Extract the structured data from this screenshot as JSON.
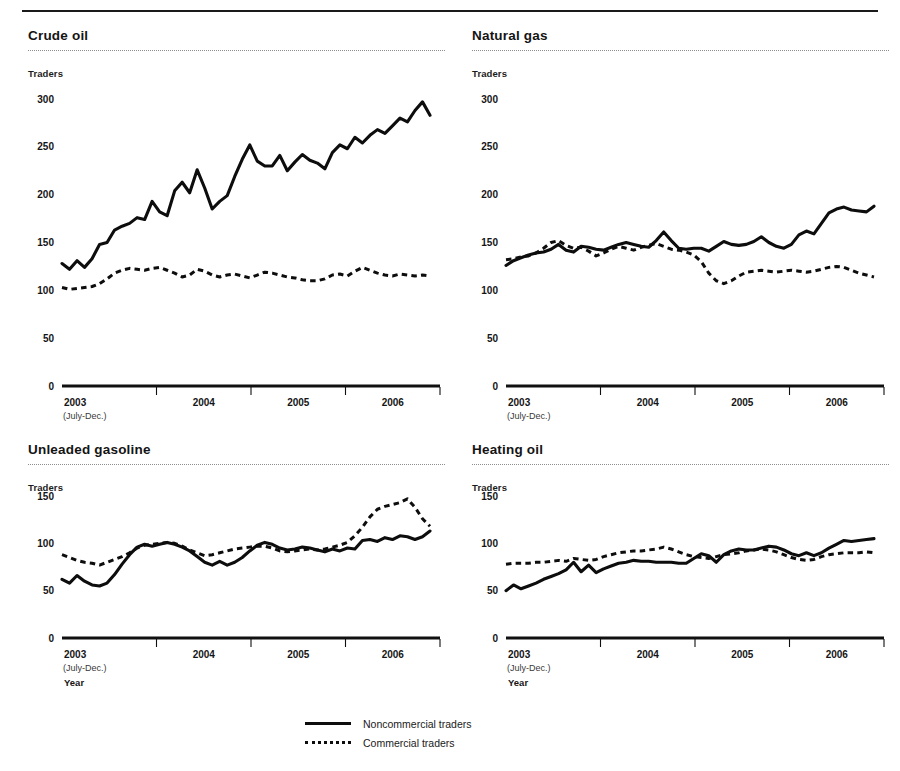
{
  "page": {
    "top_rule": true
  },
  "legend": {
    "items": [
      {
        "label": "Noncommercial traders",
        "style": "solid"
      },
      {
        "label": "Commercial traders",
        "style": "dotted"
      }
    ]
  },
  "chart_data": [
    {
      "type": "line",
      "title": "Crude oil",
      "ylabel": "Traders",
      "xlabel": "Year",
      "ylim": [
        0,
        300
      ],
      "yticks": [
        0,
        50,
        100,
        150,
        200,
        250,
        300
      ],
      "ytick_labels": [
        "0",
        "50",
        "100",
        "150",
        "200",
        "250",
        "300"
      ],
      "xtick_labels": [
        "2003",
        "2004",
        "2005",
        "2006"
      ],
      "x_sublabel": "(July-Dec.)",
      "grid": false,
      "legend_position": "bottom-center-shared",
      "series": [
        {
          "name": "Noncommercial traders",
          "style": "solid",
          "values": [
            128,
            122,
            131,
            124,
            133,
            148,
            150,
            163,
            167,
            170,
            176,
            174,
            193,
            182,
            178,
            204,
            213,
            202,
            226,
            207,
            185,
            193,
            199,
            219,
            237,
            252,
            235,
            230,
            230,
            241,
            225,
            234,
            242,
            236,
            233,
            227,
            244,
            252,
            248,
            260,
            254,
            262,
            268,
            264,
            272,
            280,
            276,
            288,
            297,
            283
          ]
        },
        {
          "name": "Commercial traders",
          "style": "dotted",
          "values": [
            103,
            101,
            102,
            103,
            104,
            107,
            112,
            118,
            121,
            123,
            122,
            121,
            123,
            124,
            121,
            118,
            114,
            116,
            122,
            120,
            116,
            114,
            116,
            117,
            115,
            113,
            116,
            119,
            118,
            116,
            114,
            113,
            111,
            110,
            110,
            112,
            116,
            117,
            115,
            120,
            124,
            121,
            118,
            116,
            115,
            117,
            116,
            115,
            116,
            115
          ]
        }
      ]
    },
    {
      "type": "line",
      "title": "Natural gas",
      "ylabel": "Traders",
      "xlabel": "Year",
      "ylim": [
        0,
        300
      ],
      "yticks": [
        0,
        50,
        100,
        150,
        200,
        250,
        300
      ],
      "ytick_labels": [
        "0",
        "50",
        "100",
        "150",
        "200",
        "250",
        "300"
      ],
      "xtick_labels": [
        "2003",
        "2004",
        "2005",
        "2006"
      ],
      "x_sublabel": "(July-Dec.)",
      "grid": false,
      "legend_position": "bottom-center-shared",
      "series": [
        {
          "name": "Noncommercial traders",
          "style": "solid",
          "values": [
            126,
            131,
            134,
            137,
            139,
            140,
            143,
            148,
            142,
            140,
            146,
            145,
            143,
            142,
            145,
            148,
            150,
            148,
            146,
            145,
            152,
            161,
            152,
            144,
            143,
            144,
            144,
            141,
            146,
            151,
            148,
            147,
            148,
            151,
            156,
            150,
            146,
            144,
            148,
            158,
            162,
            159,
            170,
            181,
            185,
            187,
            184,
            183,
            182,
            188
          ]
        },
        {
          "name": "Commercial traders",
          "style": "dotted",
          "values": [
            132,
            133,
            135,
            136,
            139,
            144,
            150,
            152,
            147,
            144,
            145,
            141,
            136,
            139,
            143,
            146,
            144,
            142,
            145,
            147,
            149,
            146,
            143,
            142,
            140,
            137,
            130,
            118,
            110,
            107,
            110,
            115,
            119,
            120,
            121,
            120,
            119,
            120,
            121,
            120,
            119,
            120,
            122,
            124,
            125,
            124,
            121,
            118,
            116,
            114
          ]
        }
      ]
    },
    {
      "type": "line",
      "title": "Unleaded gasoline",
      "ylabel": "Traders",
      "xlabel": "Year",
      "ylim": [
        0,
        150
      ],
      "yticks": [
        0,
        50,
        100,
        150
      ],
      "ytick_labels": [
        "0",
        "50",
        "100",
        "150"
      ],
      "xtick_labels": [
        "2003",
        "2004",
        "2005",
        "2006"
      ],
      "x_sublabel": "(July-Dec.)",
      "grid": false,
      "legend_position": "bottom-center-shared",
      "series": [
        {
          "name": "Noncommercial traders",
          "style": "solid",
          "values": [
            62,
            58,
            66,
            60,
            56,
            55,
            58,
            67,
            78,
            88,
            96,
            99,
            97,
            99,
            101,
            99,
            96,
            92,
            86,
            80,
            77,
            81,
            77,
            80,
            85,
            92,
            98,
            101,
            99,
            95,
            93,
            94,
            96,
            95,
            93,
            91,
            94,
            92,
            95,
            94,
            103,
            104,
            102,
            106,
            104,
            108,
            107,
            104,
            107,
            113
          ]
        },
        {
          "name": "Commercial traders",
          "style": "dotted",
          "values": [
            88,
            85,
            82,
            80,
            79,
            77,
            80,
            83,
            86,
            90,
            95,
            98,
            99,
            100,
            101,
            100,
            97,
            93,
            90,
            87,
            88,
            90,
            92,
            94,
            95,
            96,
            97,
            97,
            95,
            92,
            91,
            92,
            93,
            94,
            93,
            94,
            96,
            98,
            101,
            108,
            117,
            128,
            136,
            139,
            141,
            143,
            147,
            138,
            126,
            118
          ]
        }
      ]
    },
    {
      "type": "line",
      "title": "Heating oil",
      "ylabel": "Traders",
      "xlabel": "Year",
      "ylim": [
        0,
        150
      ],
      "yticks": [
        0,
        50,
        100,
        150
      ],
      "ytick_labels": [
        "0",
        "50",
        "100",
        "150"
      ],
      "xtick_labels": [
        "2003",
        "2004",
        "2005",
        "2006"
      ],
      "x_sublabel": "(July-Dec.)",
      "grid": false,
      "legend_position": "bottom-center-shared",
      "series": [
        {
          "name": "Noncommercial traders",
          "style": "solid",
          "values": [
            50,
            56,
            52,
            55,
            58,
            62,
            65,
            68,
            72,
            80,
            70,
            77,
            69,
            73,
            76,
            79,
            80,
            82,
            81,
            81,
            80,
            80,
            80,
            79,
            79,
            84,
            89,
            87,
            80,
            88,
            92,
            94,
            93,
            93,
            95,
            97,
            96,
            93,
            89,
            87,
            90,
            87,
            90,
            95,
            99,
            103,
            102,
            103,
            104,
            105
          ]
        },
        {
          "name": "Commercial traders",
          "style": "dotted",
          "values": [
            78,
            79,
            79,
            79,
            80,
            80,
            81,
            82,
            81,
            84,
            83,
            82,
            83,
            86,
            88,
            90,
            91,
            92,
            92,
            93,
            94,
            96,
            94,
            91,
            88,
            86,
            85,
            84,
            86,
            88,
            89,
            90,
            92,
            93,
            94,
            93,
            91,
            88,
            85,
            83,
            82,
            83,
            86,
            88,
            89,
            90,
            90,
            90,
            91,
            90
          ]
        }
      ]
    }
  ]
}
